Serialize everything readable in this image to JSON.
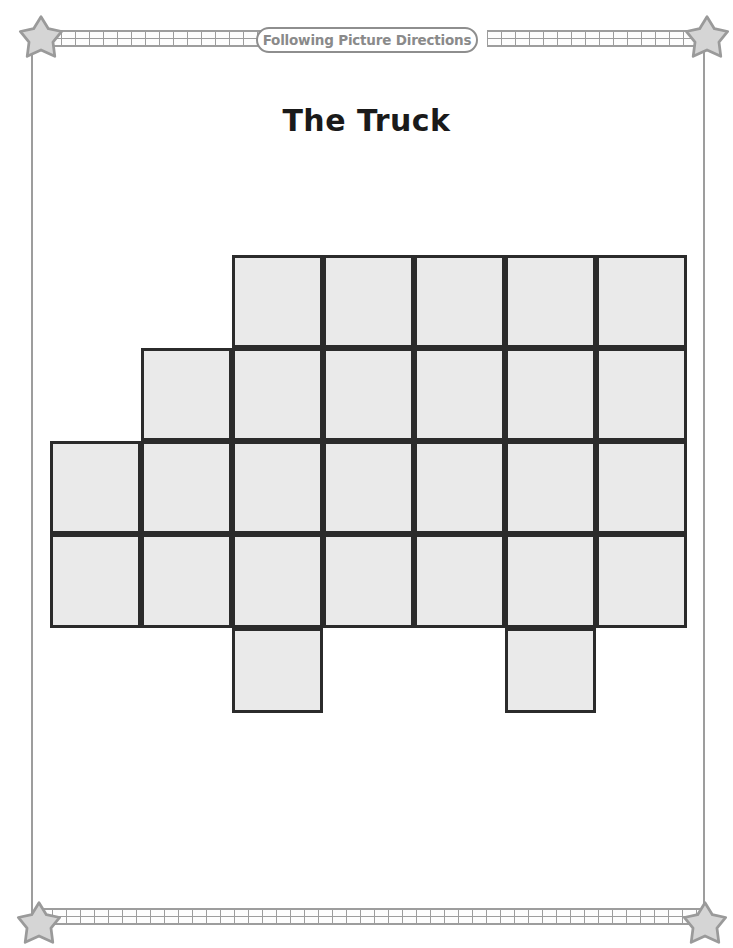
{
  "page": {
    "banner_label": "Following Picture Directions",
    "title": "The Truck",
    "background_color": "#ffffff",
    "frame_color": "#9d9d9d",
    "star_fill": "#d5d5d5",
    "star_stroke": "#9a9a9a"
  },
  "grid": {
    "description": "Truck outline drawn on a square grid, to be colored by following picture directions.",
    "columns": 7,
    "rows": 5,
    "cell_width": 91,
    "cell_height": 93,
    "origin_x": 50,
    "origin_y": 255,
    "cell_fill": "#eaeaea",
    "cell_stroke": "#2b2b2b",
    "cell_stroke_width": 3,
    "occupied": [
      {
        "row": 1,
        "col": 3
      },
      {
        "row": 1,
        "col": 4
      },
      {
        "row": 1,
        "col": 5
      },
      {
        "row": 1,
        "col": 6
      },
      {
        "row": 1,
        "col": 7
      },
      {
        "row": 2,
        "col": 2
      },
      {
        "row": 2,
        "col": 3
      },
      {
        "row": 2,
        "col": 4
      },
      {
        "row": 2,
        "col": 5
      },
      {
        "row": 2,
        "col": 6
      },
      {
        "row": 2,
        "col": 7
      },
      {
        "row": 3,
        "col": 1
      },
      {
        "row": 3,
        "col": 2
      },
      {
        "row": 3,
        "col": 3
      },
      {
        "row": 3,
        "col": 4
      },
      {
        "row": 3,
        "col": 5
      },
      {
        "row": 3,
        "col": 6
      },
      {
        "row": 3,
        "col": 7
      },
      {
        "row": 4,
        "col": 1
      },
      {
        "row": 4,
        "col": 2
      },
      {
        "row": 4,
        "col": 3
      },
      {
        "row": 4,
        "col": 4
      },
      {
        "row": 4,
        "col": 5
      },
      {
        "row": 4,
        "col": 6
      },
      {
        "row": 4,
        "col": 7
      },
      {
        "row": 5,
        "col": 3
      },
      {
        "row": 5,
        "col": 6
      }
    ],
    "row_heights": [
      93,
      93,
      93,
      94,
      85
    ],
    "total_cells": 27
  },
  "decoration": {
    "ladder_strips": [
      "top-left",
      "top-right",
      "bottom"
    ],
    "stars": [
      "top-left",
      "top-right",
      "bottom-left",
      "bottom-right"
    ]
  }
}
